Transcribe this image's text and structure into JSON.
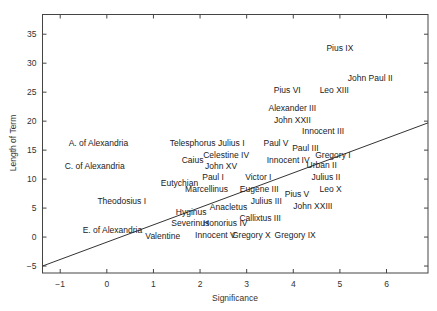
{
  "chart_data": {
    "type": "scatter",
    "title": "",
    "xlabel": "Significance",
    "ylabel": "Length of Term",
    "xlim": [
      -1.38,
      6.89
    ],
    "ylim": [
      -6.2,
      38.4
    ],
    "xticks": [
      -1,
      0,
      1,
      2,
      3,
      4,
      5,
      6
    ],
    "yticks": [
      -5,
      0,
      5,
      10,
      15,
      20,
      25,
      30,
      35
    ],
    "grid": false,
    "legend": "none",
    "marker": "text-label",
    "points": [
      {
        "label": "Pius IX",
        "x": 5.0,
        "y": 32.6
      },
      {
        "label": "John Paul II",
        "x": 5.65,
        "y": 27.4
      },
      {
        "label": "Pius VI",
        "x": 3.87,
        "y": 25.3
      },
      {
        "label": "Leo XIII",
        "x": 4.88,
        "y": 25.3
      },
      {
        "label": "Alexander III",
        "x": 3.98,
        "y": 22.2
      },
      {
        "label": "John XXII",
        "x": 3.98,
        "y": 20.2
      },
      {
        "label": "Innocent III",
        "x": 4.64,
        "y": 18.3
      },
      {
        "label": "A. of Alexandria",
        "x": -0.18,
        "y": 16.2
      },
      {
        "label": "Telesphorus",
        "x": 1.84,
        "y": 16.2
      },
      {
        "label": "Julius I",
        "x": 2.67,
        "y": 16.2
      },
      {
        "label": "Paul V",
        "x": 3.63,
        "y": 16.2
      },
      {
        "label": "Paul III",
        "x": 4.26,
        "y": 15.3
      },
      {
        "label": "Celestine IV",
        "x": 2.56,
        "y": 14.1
      },
      {
        "label": "Gregory I",
        "x": 4.85,
        "y": 14.1
      },
      {
        "label": "Caius",
        "x": 1.84,
        "y": 13.3
      },
      {
        "label": "Innocent IV",
        "x": 3.89,
        "y": 13.3
      },
      {
        "label": "Urban II",
        "x": 4.61,
        "y": 12.4
      },
      {
        "label": "C. of Alexandria",
        "x": -0.26,
        "y": 12.2
      },
      {
        "label": "John XV",
        "x": 2.45,
        "y": 12.2
      },
      {
        "label": "Paul I",
        "x": 2.28,
        "y": 10.3
      },
      {
        "label": "Victor I",
        "x": 3.25,
        "y": 10.3
      },
      {
        "label": "Julius II",
        "x": 4.7,
        "y": 10.3
      },
      {
        "label": "Eutychian",
        "x": 1.56,
        "y": 9.3
      },
      {
        "label": "Marcellinus",
        "x": 2.14,
        "y": 8.3
      },
      {
        "label": "Eugene III",
        "x": 3.27,
        "y": 8.3
      },
      {
        "label": "Leo X",
        "x": 4.8,
        "y": 8.3
      },
      {
        "label": "Pius V",
        "x": 4.08,
        "y": 7.4
      },
      {
        "label": "Theodosius I",
        "x": 0.32,
        "y": 6.2
      },
      {
        "label": "Julius III",
        "x": 3.42,
        "y": 6.2
      },
      {
        "label": "Anacletus",
        "x": 2.61,
        "y": 5.2
      },
      {
        "label": "John XXIII",
        "x": 4.42,
        "y": 5.3
      },
      {
        "label": "Hyginus",
        "x": 1.81,
        "y": 4.3
      },
      {
        "label": "Callixtus III",
        "x": 3.29,
        "y": 3.3
      },
      {
        "label": "Severinus",
        "x": 1.79,
        "y": 2.4
      },
      {
        "label": "Honorius IV",
        "x": 2.54,
        "y": 2.4
      },
      {
        "label": "E. of Alexandria",
        "x": 0.12,
        "y": 1.2
      },
      {
        "label": "Valentine",
        "x": 1.2,
        "y": 0.2
      },
      {
        "label": "Innocent V",
        "x": 2.33,
        "y": 0.3
      },
      {
        "label": "Gregory X",
        "x": 3.1,
        "y": 0.3
      },
      {
        "label": "Gregory IX",
        "x": 4.04,
        "y": 0.3
      }
    ],
    "fit_line": {
      "x": [
        -1.38,
        6.89
      ],
      "y": [
        -5.0,
        19.7
      ]
    }
  }
}
